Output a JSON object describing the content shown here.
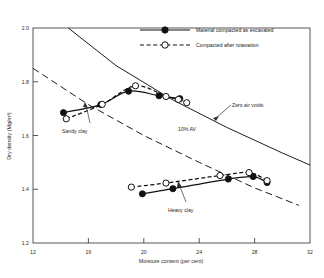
{
  "chart_data": {
    "type": "line",
    "title": "",
    "xlabel": "Moisture content (per cent)",
    "ylabel": "Dry density (Mg/m³)",
    "xlim": [
      12,
      32
    ],
    "ylim": [
      1.2,
      2.0
    ],
    "xticks": [
      12,
      16,
      20,
      24,
      28,
      32
    ],
    "yticks": [
      1.2,
      1.4,
      1.6,
      1.8,
      2.0
    ],
    "xtick_labels": [
      "12",
      "16",
      "20",
      "24",
      "28",
      "32"
    ],
    "ytick_labels": [
      "1.2",
      "1.4",
      "1.6",
      "1.8",
      "2.0"
    ],
    "grid": false,
    "legend_position": "top-right",
    "legend": [
      {
        "label": "Material compacted as excavated",
        "marker": "filled-circle",
        "line": "solid"
      },
      {
        "label": "Compacted after rotavation",
        "marker": "open-circle",
        "line": "dashed"
      }
    ],
    "annotations": [
      {
        "text": "Zero air voids",
        "x": 26.4,
        "y": 1.655
      },
      {
        "text": "10% AV",
        "x": 21.5,
        "y": 1.585
      },
      {
        "text": "Sandy clay",
        "x": 16.0,
        "y": 1.515
      },
      {
        "text": "Heavy clay",
        "x": 22.3,
        "y": 1.255
      }
    ],
    "series": [
      {
        "name": "Zero air voids",
        "style": "solid-reference",
        "points": [
          {
            "x": 14.55,
            "y": 2.0
          },
          {
            "x": 18.0,
            "y": 1.86
          },
          {
            "x": 22.0,
            "y": 1.735
          },
          {
            "x": 26.0,
            "y": 1.63
          },
          {
            "x": 30.0,
            "y": 1.535
          },
          {
            "x": 32.0,
            "y": 1.49
          }
        ]
      },
      {
        "name": "10% AV",
        "style": "dashed-reference",
        "points": [
          {
            "x": 12.0,
            "y": 1.85
          },
          {
            "x": 16.0,
            "y": 1.715
          },
          {
            "x": 20.0,
            "y": 1.6
          },
          {
            "x": 24.0,
            "y": 1.5
          },
          {
            "x": 28.0,
            "y": 1.405
          },
          {
            "x": 31.2,
            "y": 1.34
          }
        ]
      },
      {
        "name": "Sandy clay - Material compacted as excavated",
        "soil": "sandy clay",
        "marker": "filled-circle",
        "line": "solid",
        "points": [
          {
            "x": 14.2,
            "y": 1.685
          },
          {
            "x": 16.9,
            "y": 1.715
          },
          {
            "x": 18.9,
            "y": 1.765
          },
          {
            "x": 21.1,
            "y": 1.748
          },
          {
            "x": 22.6,
            "y": 1.737
          }
        ]
      },
      {
        "name": "Sandy clay - Compacted after rotavation",
        "soil": "sandy clay",
        "marker": "open-circle",
        "line": "dashed",
        "points": [
          {
            "x": 14.4,
            "y": 1.662
          },
          {
            "x": 17.0,
            "y": 1.716
          },
          {
            "x": 19.4,
            "y": 1.785
          },
          {
            "x": 21.6,
            "y": 1.745
          },
          {
            "x": 22.5,
            "y": 1.734
          },
          {
            "x": 23.1,
            "y": 1.722
          }
        ]
      },
      {
        "name": "Heavy clay - Material compacted as excavated",
        "soil": "heavy clay",
        "marker": "filled-circle",
        "line": "solid",
        "points": [
          {
            "x": 19.9,
            "y": 1.383
          },
          {
            "x": 22.1,
            "y": 1.402
          },
          {
            "x": 26.1,
            "y": 1.438
          },
          {
            "x": 27.9,
            "y": 1.447
          },
          {
            "x": 28.9,
            "y": 1.425
          }
        ]
      },
      {
        "name": "Heavy clay - Compacted after rotavation",
        "soil": "heavy clay",
        "marker": "open-circle",
        "line": "dashed",
        "points": [
          {
            "x": 19.1,
            "y": 1.408
          },
          {
            "x": 21.6,
            "y": 1.423
          },
          {
            "x": 25.5,
            "y": 1.451
          },
          {
            "x": 27.6,
            "y": 1.462
          },
          {
            "x": 28.9,
            "y": 1.432
          }
        ]
      }
    ]
  },
  "colors": {
    "line": "#111111",
    "axis": "#444444",
    "text": "#2b2b2b",
    "background": "#ffffff"
  }
}
